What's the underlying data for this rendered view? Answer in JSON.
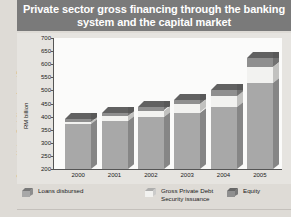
{
  "title": "Private sector gross financing through the banking system and the capital market",
  "source_note": "Source: Various Bank Negara Annual Reports",
  "colors": {
    "title_bar": "#7a7a7a",
    "title_text": "#ffffff",
    "panel_bg": "#e6e4e0",
    "plot_bg": "#fbfbfa",
    "loans": "#a8a8a8",
    "debt_security": "#f2f2f0",
    "equity": "#8f8f8f"
  },
  "legend": {
    "items": [
      {
        "label": "Loans disbursed",
        "color": "#a8a8a8",
        "icon": "cube-swatch-icon"
      },
      {
        "label": "Gross Private Debt Security issuance",
        "color": "#f2f2f0",
        "icon": "cube-swatch-icon"
      },
      {
        "label": "Equity",
        "color": "#8f8f8f",
        "icon": "cube-swatch-icon"
      }
    ]
  },
  "chart_data": {
    "type": "bar",
    "subtype": "stacked-3d-column",
    "title": "Private sector gross financing through the banking system and the capital market",
    "xlabel": "",
    "ylabel": "RM billion",
    "ylim": [
      200,
      700
    ],
    "ytick_step": 50,
    "yticks": [
      200,
      250,
      300,
      350,
      400,
      450,
      500,
      550,
      600,
      650,
      700
    ],
    "grid": false,
    "legend_position": "bottom",
    "categories": [
      "2000",
      "2001",
      "2002",
      "2003",
      "2004",
      "2005"
    ],
    "series": [
      {
        "name": "Loans disbursed",
        "values": [
          370,
          385,
          400,
          415,
          435,
          530
        ]
      },
      {
        "name": "Gross Private Debt Security issuance",
        "values": [
          8,
          18,
          22,
          32,
          42,
          60
        ]
      },
      {
        "name": "Equity",
        "values": [
          12,
          12,
          13,
          15,
          25,
          35
        ]
      }
    ],
    "totals": [
      390,
      415,
      435,
      462,
      502,
      625
    ]
  }
}
